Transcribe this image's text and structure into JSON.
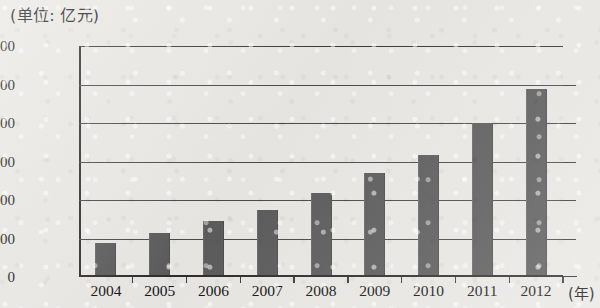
{
  "caption": {
    "unit_label": "(单位: 亿元)",
    "x_axis_unit": "(年)"
  },
  "chart_data": {
    "type": "bar",
    "title": "",
    "subtitle": "",
    "xlabel": "(年)",
    "ylabel": "(单位: 亿元)",
    "categories": [
      "2004",
      "2005",
      "2006",
      "2007",
      "2008",
      "2009",
      "2010",
      "2011",
      "2012"
    ],
    "values": [
      1790,
      2290,
      2900,
      3480,
      4380,
      5380,
      6330,
      8000,
      9760
    ],
    "series": [
      {
        "name": "",
        "values": [
          1790,
          2290,
          2900,
          3480,
          4380,
          5380,
          6330,
          8000,
          9760
        ]
      }
    ],
    "ylim": [
      0,
      12000
    ],
    "ytick_labels": [
      "0",
      "2000",
      "4000",
      "6000",
      "8000",
      "10000",
      "12000"
    ],
    "ytick_values": [
      0,
      2000,
      4000,
      6000,
      8000,
      10000,
      12000
    ],
    "grid": true,
    "grid_axis": "y",
    "legend": false,
    "legend_position": "none",
    "bar_color": "#5c5c5c",
    "axis_color": "#2e2e2e",
    "gridline_color": "#4a4a4a",
    "background_color": "#e9e8e4"
  }
}
